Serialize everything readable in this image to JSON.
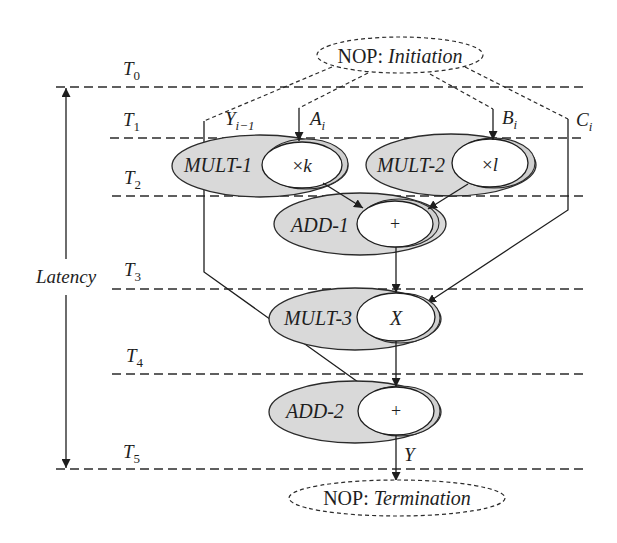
{
  "colors": {
    "unit_fill": "#d9d9d9",
    "operation_fill": "#ffffff",
    "line": "#1e1e1e"
  },
  "time_steps": [
    {
      "var": "T",
      "sub": "0"
    },
    {
      "var": "T",
      "sub": "1"
    },
    {
      "var": "T",
      "sub": "2"
    },
    {
      "var": "T",
      "sub": "3"
    },
    {
      "var": "T",
      "sub": "4"
    },
    {
      "var": "T",
      "sub": "5"
    }
  ],
  "latency": {
    "label": "Latency"
  },
  "nop_start": {
    "prefix": "NOP:",
    "name": "Initiation"
  },
  "nop_end": {
    "prefix": "NOP:",
    "name": "Termination"
  },
  "inputs": {
    "y_prev": {
      "var": "Y",
      "sub": "i−1"
    },
    "a": {
      "var": "A",
      "sub": "i"
    },
    "b": {
      "var": "B",
      "sub": "i"
    },
    "c": {
      "var": "C",
      "sub": "i"
    }
  },
  "output": {
    "var": "Y"
  },
  "nodes": [
    {
      "id": "mult1",
      "unit": "MULT-1",
      "op_symbol": "×",
      "op_var": "k",
      "step": "T2"
    },
    {
      "id": "mult2",
      "unit": "MULT-2",
      "op_symbol": "×",
      "op_var": "l",
      "step": "T2"
    },
    {
      "id": "add1",
      "unit": "ADD-1",
      "op_symbol": "+",
      "step": "T3"
    },
    {
      "id": "mult3",
      "unit": "MULT-3",
      "op_var": "X",
      "step": "T4"
    },
    {
      "id": "add2",
      "unit": "ADD-2",
      "op_symbol": "+",
      "step": "T5"
    }
  ],
  "edges": [
    {
      "from": "NOP: Initiation",
      "to": "Y_{i-1}",
      "style": "dashed"
    },
    {
      "from": "NOP: Initiation",
      "to": "A_i",
      "style": "dashed"
    },
    {
      "from": "NOP: Initiation",
      "to": "B_i",
      "style": "dashed"
    },
    {
      "from": "NOP: Initiation",
      "to": "C_i",
      "style": "dashed"
    },
    {
      "from": "A_i",
      "to": "MULT-1"
    },
    {
      "from": "B_i",
      "to": "MULT-2"
    },
    {
      "from": "MULT-1",
      "to": "ADD-1"
    },
    {
      "from": "MULT-2",
      "to": "ADD-1"
    },
    {
      "from": "ADD-1",
      "to": "MULT-3"
    },
    {
      "from": "C_i",
      "to": "MULT-3"
    },
    {
      "from": "MULT-3",
      "to": "ADD-2"
    },
    {
      "from": "Y_{i-1}",
      "to": "ADD-2"
    },
    {
      "from": "ADD-2",
      "to": "NOP: Termination",
      "label": "Y"
    }
  ]
}
